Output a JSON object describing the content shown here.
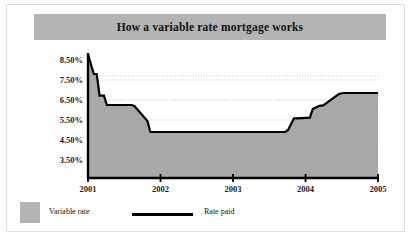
{
  "chart_data": {
    "type": "area",
    "title": "How a variable rate mortgage works",
    "xlabel": "",
    "ylabel": "",
    "xlim": [
      2001,
      2005
    ],
    "ylim": [
      3.0,
      8.9
    ],
    "ytick_values": [
      8.5,
      7.5,
      6.5,
      5.5,
      4.5,
      3.5
    ],
    "ytick_labels": [
      "8.50%",
      "7.50%",
      "6.50%",
      "5.50%",
      "4.50%",
      "3.50%"
    ],
    "xtick_values": [
      2001,
      2002,
      2003,
      2004,
      2005
    ],
    "xtick_labels": [
      "2001",
      "2002",
      "2003",
      "2004",
      "2005"
    ],
    "grid": "horizontal-dotted",
    "legend_position": "below",
    "legend": [
      {
        "name": "Variable rate",
        "kind": "area-swatch",
        "color": "#b4b4b4"
      },
      {
        "name": "Rate paid",
        "kind": "line",
        "color": "#000000"
      }
    ],
    "series": [
      {
        "name": "Rate paid",
        "color": "#000000",
        "fill": "#a8a8a8",
        "x": [
          2001.0,
          2001.0,
          2001.08,
          2001.12,
          2001.16,
          2001.22,
          2001.26,
          2001.6,
          2001.64,
          2001.82,
          2001.86,
          2003.72,
          2003.76,
          2003.84,
          2003.88,
          2004.06,
          2004.1,
          2004.2,
          2004.24,
          2004.46,
          2004.52,
          2005.0
        ],
        "y": [
          3.05,
          8.78,
          7.8,
          7.8,
          6.72,
          6.72,
          6.25,
          6.25,
          6.2,
          5.45,
          4.9,
          4.9,
          5.0,
          5.58,
          5.58,
          5.62,
          6.05,
          6.22,
          6.22,
          6.8,
          6.85,
          6.85
        ]
      }
    ]
  },
  "figure": {
    "title": "How a variable rate mortgage works",
    "background": "#ffffff",
    "banner_color": "#b4b4b4",
    "area_color": "#a8a8a8",
    "line_color": "#000000"
  }
}
